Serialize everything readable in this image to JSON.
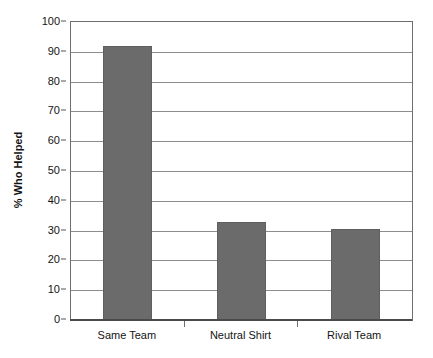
{
  "chart_data": {
    "type": "bar",
    "title": "",
    "subtitle": "",
    "xlabel": "",
    "ylabel": "% Who Helped",
    "categories": [
      "Same Team",
      "Neutral Shirt",
      "Rival Team"
    ],
    "values": [
      92,
      33,
      30.5
    ],
    "ylim": [
      0,
      100
    ],
    "yticks": [
      0,
      10,
      20,
      30,
      40,
      50,
      60,
      70,
      80,
      90,
      100
    ],
    "ytick_labels": [
      "0",
      "10",
      "20",
      "30",
      "40",
      "50",
      "60",
      "70",
      "80",
      "90",
      "100"
    ],
    "grid": "horizontal",
    "legend": "none",
    "bar_color": "#6b6b6b",
    "plot_border_color": "#6e6e6e",
    "gridline_color": "#8d8d8d",
    "background_color": "#ffffff",
    "annotations": []
  }
}
